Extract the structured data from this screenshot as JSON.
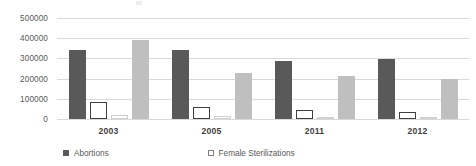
{
  "chart_data": {
    "type": "bar",
    "title": "",
    "subtitle": "",
    "xlabel": "",
    "ylabel": "",
    "categories": [
      "2003",
      "2005",
      "2011",
      "2012"
    ],
    "ylim": [
      0,
      500000
    ],
    "ytick_values": [
      500000,
      400000,
      300000,
      200000,
      100000,
      0
    ],
    "ytick_labels": [
      "500000",
      "400000",
      "300000",
      "200000",
      "100000",
      "0"
    ],
    "ytick_interval": 100000,
    "grid": true,
    "grid_axis": "y",
    "legend_position": "bottom",
    "series": [
      {
        "name": "Abortions",
        "color": "#595959",
        "values": [
          342000,
          340000,
          286000,
          298000
        ]
      },
      {
        "name": "Female Sterilizations",
        "color": "#ffffff",
        "values": [
          82000,
          58000,
          44000,
          36000
        ]
      },
      {
        "name": "",
        "color": "#ffffff",
        "values": [
          22000,
          16000,
          7000,
          4000
        ]
      },
      {
        "name": "",
        "color": "#bfbfbf",
        "values": [
          390000,
          228000,
          215000,
          200000
        ]
      }
    ]
  },
  "legend": {
    "items": [
      {
        "label": "Abortions"
      },
      {
        "label": "Female Sterilizations"
      },
      {
        "label": ""
      },
      {
        "label": ""
      }
    ]
  },
  "colors": {
    "series_1": "#595959",
    "series_4": "#bfbfbf",
    "gridline": "#d9d9d9",
    "axis_text": "#595959",
    "background": "#ffffff"
  }
}
